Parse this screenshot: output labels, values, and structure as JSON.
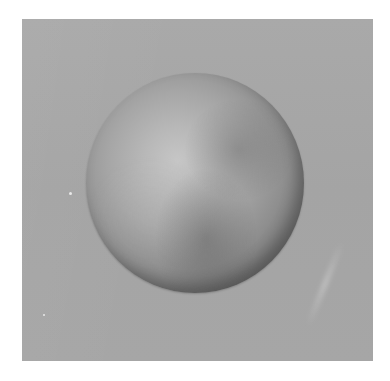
{
  "image": {
    "subject": "shaded sphere",
    "background_color": "#a7a7a7",
    "frame_color": "#ffffff",
    "sphere_highlight_color": "#c6c6c6",
    "sphere_shadow_color": "#3a3a3a"
  }
}
